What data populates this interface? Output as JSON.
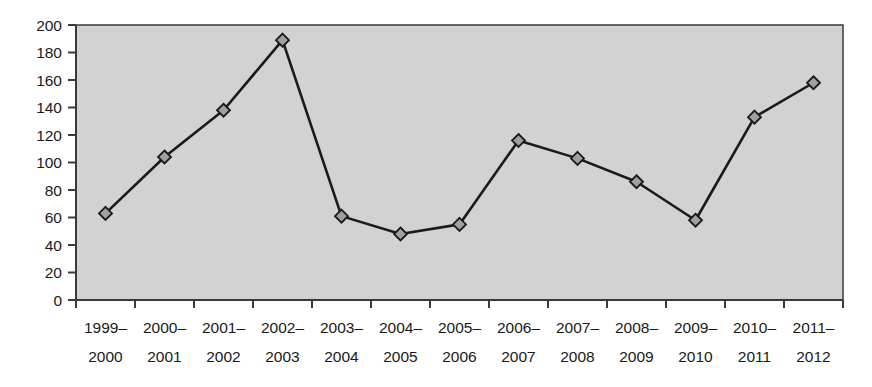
{
  "chart_data": {
    "type": "line",
    "title": "",
    "subtitle": "",
    "xlabel": "",
    "ylabel": "",
    "categories": [
      "1999–2000",
      "2000–2001",
      "2001–2002",
      "2002–2003",
      "2003–2004",
      "2004–2005",
      "2005–2006",
      "2006–2007",
      "2007–2008",
      "2008–2009",
      "2009–2010",
      "2010–2011",
      "2011–2012"
    ],
    "category_lines": [
      [
        "1999–",
        "2000"
      ],
      [
        "2000–",
        "2001"
      ],
      [
        "2001–",
        "2002"
      ],
      [
        "2002–",
        "2003"
      ],
      [
        "2003–",
        "2004"
      ],
      [
        "2004–",
        "2005"
      ],
      [
        "2005–",
        "2006"
      ],
      [
        "2006–",
        "2007"
      ],
      [
        "2007–",
        "2008"
      ],
      [
        "2008–",
        "2009"
      ],
      [
        "2009–",
        "2010"
      ],
      [
        "2010–",
        "2011"
      ],
      [
        "2011–",
        "2012"
      ]
    ],
    "values": [
      63,
      104,
      138,
      189,
      61,
      48,
      55,
      116,
      103,
      86,
      58,
      133,
      158
    ],
    "ylim": [
      0,
      200
    ],
    "ytick_step": 20,
    "yticks": [
      0,
      20,
      40,
      60,
      80,
      100,
      120,
      140,
      160,
      180,
      200
    ],
    "ytick_labels": [
      "0",
      "20",
      "40",
      "60",
      "80",
      "100",
      "120",
      "140",
      "160",
      "180",
      "200"
    ],
    "grid": false,
    "legend": false,
    "legend_position": "none",
    "marker": "diamond",
    "colors": {
      "plot_background": "#d2d2d2",
      "page_background": "#ffffff",
      "line": "#1a1a1a",
      "marker_fill": "#a0a0a0",
      "marker_edge": "#1a1a1a",
      "axis": "#3a3a3a",
      "tick_label": "#1a1a1a"
    }
  },
  "layout": {
    "plot_left": 76,
    "plot_right": 843,
    "plot_top": 25,
    "plot_bottom": 300,
    "xlabel_line1_y": 333,
    "xlabel_line2_y": 362,
    "marker_size": 13
  }
}
